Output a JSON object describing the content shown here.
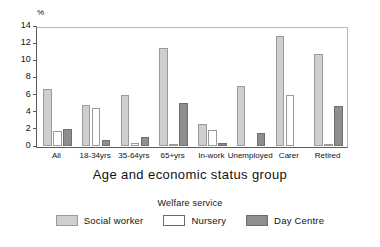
{
  "chart_data": {
    "type": "bar",
    "title": "",
    "xlabel": "Age and economic status group",
    "ylabel": "%",
    "ylim": [
      0,
      14
    ],
    "yticks": [
      0,
      2,
      4,
      6,
      8,
      10,
      12,
      14
    ],
    "grid": false,
    "legend_title": "Welfare service",
    "legend_position": "bottom",
    "categories": [
      "All",
      "18-34yrs",
      "35-64yrs",
      "65+yrs",
      "In-work",
      "Unemployed",
      "Carer",
      "Retired"
    ],
    "series": [
      {
        "name": "Social worker",
        "color": "#cfcfcf",
        "values": [
          6.6,
          4.8,
          5.9,
          11.4,
          2.6,
          7.0,
          12.8,
          10.7
        ]
      },
      {
        "name": "Nursery",
        "color": "#ffffff",
        "values": [
          1.8,
          4.4,
          0.3,
          0.2,
          1.9,
          0.0,
          5.9,
          0.2
        ]
      },
      {
        "name": "Day Centre",
        "color": "#8f8f8f",
        "values": [
          2.0,
          0.7,
          1.0,
          5.0,
          0.4,
          1.5,
          0.0,
          4.7
        ]
      }
    ]
  }
}
